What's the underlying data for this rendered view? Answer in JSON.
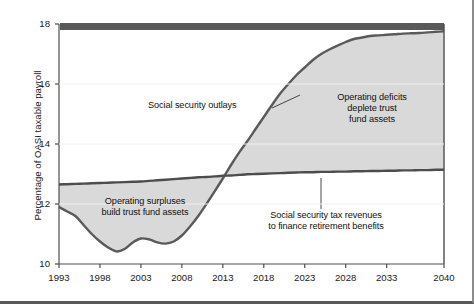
{
  "chart_data": {
    "type": "area",
    "title": "",
    "subtitle": "",
    "xlabel": "",
    "ylabel": "Percentage of OASI taxable payroll",
    "xlim": [
      1993,
      2040
    ],
    "ylim": [
      10,
      18
    ],
    "grid": false,
    "legend_position": "none",
    "xticks": [
      "1993",
      "1998",
      "2003",
      "2008",
      "2013",
      "2018",
      "2023",
      "2028",
      "2033",
      "2040"
    ],
    "xtick_values": [
      1993,
      1998,
      2003,
      2008,
      2013,
      2018,
      2023,
      2028,
      2033,
      2040
    ],
    "yticks": [
      "10",
      "12",
      "14",
      "16",
      "18"
    ],
    "ytick_values": [
      10,
      12,
      14,
      16,
      18
    ],
    "x": [
      1993,
      1994,
      1995,
      1996,
      1997,
      1998,
      1999,
      2000,
      2001,
      2002,
      2003,
      2004,
      2005,
      2006,
      2007,
      2008,
      2009,
      2010,
      2011,
      2012,
      2013,
      2014,
      2015,
      2016,
      2017,
      2018,
      2019,
      2020,
      2021,
      2022,
      2023,
      2024,
      2025,
      2026,
      2027,
      2028,
      2029,
      2030,
      2031,
      2032,
      2033,
      2034,
      2035,
      2036,
      2037,
      2038,
      2039,
      2040
    ],
    "series": [
      {
        "name": "Social security outlays",
        "color": "#5a5a5a",
        "values": [
          11.9,
          11.75,
          11.6,
          11.3,
          11.0,
          10.75,
          10.55,
          10.42,
          10.5,
          10.72,
          10.85,
          10.82,
          10.72,
          10.68,
          10.75,
          10.95,
          11.25,
          11.6,
          12.0,
          12.42,
          12.85,
          13.3,
          13.72,
          14.1,
          14.5,
          14.9,
          15.3,
          15.68,
          16.0,
          16.3,
          16.55,
          16.8,
          17.0,
          17.15,
          17.28,
          17.4,
          17.5,
          17.55,
          17.6,
          17.62,
          17.64,
          17.66,
          17.68,
          17.69,
          17.7,
          17.72,
          17.74,
          17.76
        ]
      },
      {
        "name": "Social security tax revenues to finance retirement benefits",
        "color": "#4d4d4d",
        "values": [
          12.65,
          12.66,
          12.67,
          12.68,
          12.69,
          12.7,
          12.71,
          12.72,
          12.73,
          12.74,
          12.75,
          12.77,
          12.79,
          12.81,
          12.83,
          12.85,
          12.87,
          12.89,
          12.9,
          12.92,
          12.94,
          12.95,
          12.97,
          12.99,
          13.0,
          13.01,
          13.02,
          13.03,
          13.04,
          13.05,
          13.06,
          13.06,
          13.07,
          13.07,
          13.08,
          13.08,
          13.09,
          13.09,
          13.1,
          13.1,
          13.11,
          13.11,
          13.12,
          13.12,
          13.13,
          13.13,
          13.14,
          13.14
        ]
      }
    ],
    "crossover_year": 2016,
    "fill_color": "#d9d9d9",
    "top_bar_color": "#595959",
    "annotations": [
      {
        "name": "social-security-outlays",
        "text": "Social security outlays",
        "x": 2011,
        "y": 15.0
      },
      {
        "name": "operating-deficits",
        "text": "Operating deficits\ndeplete trust\nfund assets",
        "x": 2030,
        "y": 15.3
      },
      {
        "name": "operating-surpluses",
        "text": "Operating surpluses\nbuild trust fund assets",
        "x": 2003,
        "y": 11.9
      },
      {
        "name": "social-security-tax-revenues",
        "text": "Social security tax revenues\nto finance retirement benefits",
        "x": 2029,
        "y": 11.2
      }
    ]
  },
  "labels": {
    "ylabel": "Percentage of OASI taxable payroll",
    "ann_outlays": "Social security outlays",
    "ann_deficits": "Operating deficits\ndeplete trust\nfund assets",
    "ann_surpluses": "Operating surpluses\nbuild trust fund assets",
    "ann_revenues": "Social security tax revenues\nto finance retirement benefits"
  }
}
